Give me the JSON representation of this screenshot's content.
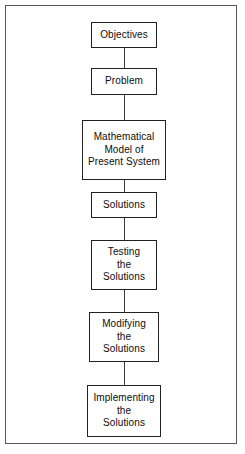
{
  "diagram": {
    "orientation": "vertical",
    "accent_color": "#222222",
    "frame_color": "#585858",
    "background_color": "#ffffff",
    "nodes": [
      {
        "id": "objectives",
        "label": "Objectives",
        "lines": 1,
        "x": 124,
        "y": 22,
        "width": 66,
        "height": 26
      },
      {
        "id": "problem",
        "label": "Problem",
        "lines": 1,
        "x": 124,
        "y": 68,
        "width": 66,
        "height": 27
      },
      {
        "id": "mathematical-model",
        "label": "Mathematical\nModel of\nPresent System",
        "lines": 3,
        "x": 124,
        "y": 120,
        "width": 84,
        "height": 60
      },
      {
        "id": "solutions",
        "label": "Solutions",
        "lines": 1,
        "x": 124,
        "y": 192,
        "width": 66,
        "height": 26
      },
      {
        "id": "testing-the-solutions",
        "label": "Testing\nthe\nSolutions",
        "lines": 3,
        "x": 124,
        "y": 240,
        "width": 66,
        "height": 50
      },
      {
        "id": "modifying-the-solutions",
        "label": "Modifying\nthe\nSolutions",
        "lines": 3,
        "x": 124,
        "y": 312,
        "width": 70,
        "height": 50
      },
      {
        "id": "implementing-the-solutions",
        "label": "Implementing\nthe\nSolutions",
        "lines": 3,
        "x": 124,
        "y": 385,
        "width": 74,
        "height": 52
      }
    ],
    "connectors": [
      {
        "id": "objectives-to-problem",
        "from": "objectives",
        "to": "problem",
        "x": 124,
        "y": 48,
        "length": 20
      },
      {
        "id": "problem-to-mathematical-model",
        "from": "problem",
        "to": "mathematical-model",
        "x": 124,
        "y": 95,
        "length": 25
      },
      {
        "id": "mathematical-model-to-solutions",
        "from": "mathematical-model",
        "to": "solutions",
        "x": 124,
        "y": 180,
        "length": 12
      },
      {
        "id": "solutions-to-testing",
        "from": "solutions",
        "to": "testing-the-solutions",
        "x": 124,
        "y": 218,
        "length": 22
      },
      {
        "id": "testing-to-modifying",
        "from": "testing-the-solutions",
        "to": "modifying-the-solutions",
        "x": 124,
        "y": 290,
        "length": 22
      },
      {
        "id": "modifying-to-implementing",
        "from": "modifying-the-solutions",
        "to": "implementing-the-solutions",
        "x": 124,
        "y": 362,
        "length": 23
      }
    ]
  }
}
